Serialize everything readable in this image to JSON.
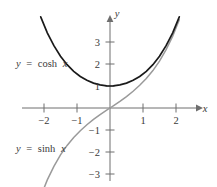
{
  "chart_data": {
    "type": "line",
    "title": "",
    "xlabel": "x",
    "ylabel": "y",
    "xlim": [
      -2.35,
      2.6
    ],
    "ylim": [
      -3.6,
      3.9
    ],
    "grid": false,
    "legend": "inline-annotations",
    "xticks": [
      -2,
      -1,
      1,
      2
    ],
    "xtick_labels": [
      "−2",
      "−1",
      "1",
      "2"
    ],
    "yticks": [
      -3,
      -2,
      -1,
      1,
      2,
      3
    ],
    "ytick_labels": [
      "−3",
      "−2",
      "−1",
      "1",
      "2",
      "3"
    ],
    "series": [
      {
        "name": "y = cosh x",
        "color": "#1a1a1a",
        "x": [
          -2.1,
          -1.9,
          -1.7,
          -1.5,
          -1.3,
          -1.1,
          -0.9,
          -0.7,
          -0.5,
          -0.3,
          -0.1,
          0,
          0.1,
          0.3,
          0.5,
          0.7,
          0.9,
          1.1,
          1.3,
          1.5,
          1.7,
          1.9,
          2.1
        ],
        "values": [
          4.14,
          3.42,
          2.83,
          2.35,
          1.97,
          1.67,
          1.43,
          1.26,
          1.13,
          1.05,
          1.01,
          1,
          1.01,
          1.05,
          1.13,
          1.26,
          1.43,
          1.67,
          1.97,
          2.35,
          2.83,
          3.42,
          4.14
        ]
      },
      {
        "name": "y = sinh x",
        "color": "#9a9a9a",
        "x": [
          -2.1,
          -1.9,
          -1.7,
          -1.5,
          -1.3,
          -1.1,
          -0.9,
          -0.7,
          -0.5,
          -0.3,
          -0.1,
          0,
          0.1,
          0.3,
          0.5,
          0.7,
          0.9,
          1.1,
          1.3,
          1.5,
          1.7,
          1.9,
          2.1
        ],
        "values": [
          -4.02,
          -3.27,
          -2.65,
          -2.13,
          -1.7,
          -1.34,
          -1.03,
          -0.76,
          -0.52,
          -0.3,
          -0.1,
          0,
          0.1,
          0.3,
          0.52,
          0.76,
          1.03,
          1.34,
          1.7,
          2.13,
          2.65,
          3.27,
          4.02
        ]
      }
    ],
    "annotations": [
      {
        "text": "y = cosh x",
        "x": -2.0,
        "y": 1.95
      },
      {
        "text": "y = sinh x",
        "x": -2.0,
        "y": -2.0
      }
    ]
  },
  "labels": {
    "cosh_lhs": "y",
    "cosh_eq": "=",
    "cosh_rhs": "cosh",
    "cosh_var": "x",
    "sinh_lhs": "y",
    "sinh_eq": "=",
    "sinh_rhs": "sinh",
    "sinh_var": "x",
    "axis_x": "x",
    "axis_y": "y",
    "x_neg2": "−2",
    "x_neg1": "−1",
    "x_pos1": "1",
    "x_pos2": "2",
    "y_pos3": "3",
    "y_pos2": "2",
    "y_pos1": "1",
    "y_neg1": "−1",
    "y_neg2": "−2",
    "y_neg3": "−3"
  }
}
